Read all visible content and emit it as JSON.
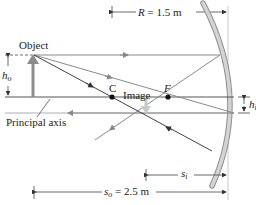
{
  "diagram": {
    "labels": {
      "object": "Object",
      "image": "Image",
      "principal_axis": "Principal axis",
      "center": "C",
      "focal": "F",
      "radius_symbol": "R",
      "radius_value": "= 1.5 m",
      "object_height_symbol": "h",
      "object_height_sub": "o",
      "image_height_symbol": "h",
      "image_height_sub": "i",
      "image_distance_symbol": "s",
      "image_distance_sub": "i",
      "object_distance_symbol": "s",
      "object_distance_sub": "o",
      "object_distance_value": "= 2.5 m"
    },
    "colors": {
      "axis": "#555555",
      "rays_dark": "#444444",
      "rays_light": "#8a8a8a",
      "mirror": "#bdbdbd",
      "mirror_edge": "#8f8f8f",
      "object_arrow": "#8c8c8c",
      "image_arrow": "#c8c8c8",
      "points": "#111111"
    },
    "values": {
      "R_m": 1.5,
      "s_o_m": 2.5
    }
  }
}
